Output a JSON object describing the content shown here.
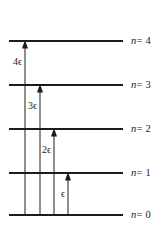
{
  "figure": {
    "type": "energy-level-diagram",
    "background_color": "#ffffff",
    "line_color": "#1c1c1c",
    "width": 163,
    "height": 232
  },
  "levels": [
    {
      "id": "n4",
      "label": "n = 4",
      "n_symbol": "n",
      "equals_value": "= 4",
      "quantum_number": 4,
      "y": 41,
      "x_start": 9,
      "x_end": 123,
      "label_x": 131,
      "label_y": 36
    },
    {
      "id": "n3",
      "label": "n = 3",
      "n_symbol": "n",
      "equals_value": "= 3",
      "quantum_number": 3,
      "y": 85,
      "x_start": 9,
      "x_end": 123,
      "label_x": 131,
      "label_y": 80
    },
    {
      "id": "n2",
      "label": "n = 2",
      "n_symbol": "n",
      "equals_value": "= 2",
      "quantum_number": 2,
      "y": 129,
      "x_start": 9,
      "x_end": 123,
      "label_x": 131,
      "label_y": 124
    },
    {
      "id": "n1",
      "label": "n = 1",
      "n_symbol": "n",
      "equals_value": "= 1",
      "quantum_number": 1,
      "y": 173,
      "x_start": 9,
      "x_end": 123,
      "label_x": 131,
      "label_y": 168
    },
    {
      "id": "n0",
      "label": "n = 0",
      "n_symbol": "n",
      "equals_value": "= 0",
      "quantum_number": 0,
      "y": 215,
      "x_start": 9,
      "x_end": 123,
      "label_x": 131,
      "label_y": 210
    }
  ],
  "transitions": [
    {
      "id": "t4",
      "label": "4ϵ",
      "coefficient": 4,
      "unit": "ϵ",
      "x": 25,
      "y_from": 215,
      "y_to": 41,
      "label_x": 13,
      "label_y": 57
    },
    {
      "id": "t3",
      "label": "3ϵ",
      "coefficient": 3,
      "unit": "ϵ",
      "x": 40,
      "y_from": 215,
      "y_to": 85,
      "label_x": 28,
      "label_y": 101
    },
    {
      "id": "t2",
      "label": "2ϵ",
      "coefficient": 2,
      "unit": "ϵ",
      "x": 54,
      "y_from": 215,
      "y_to": 129,
      "label_x": 42,
      "label_y": 145
    },
    {
      "id": "t1",
      "label": "ϵ",
      "coefficient": 1,
      "unit": "ϵ",
      "x": 68,
      "y_from": 215,
      "y_to": 173,
      "label_x": 61,
      "label_y": 189
    }
  ]
}
